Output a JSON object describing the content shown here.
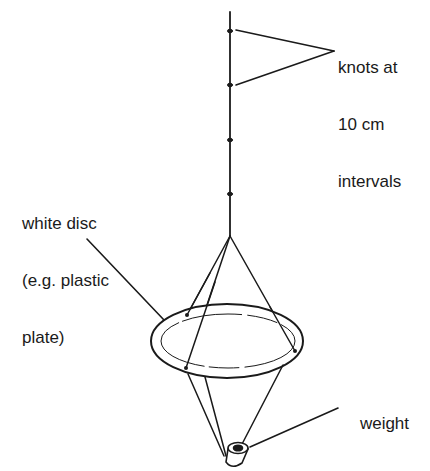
{
  "diagram": {
    "labels": {
      "knots": [
        "knots at",
        "10 cm",
        "intervals"
      ],
      "disc": [
        "white disc",
        "(e.g. plastic",
        "plate)"
      ],
      "weight": "weight"
    },
    "colors": {
      "ink": "#1a1a1a",
      "background": "#ffffff"
    }
  }
}
